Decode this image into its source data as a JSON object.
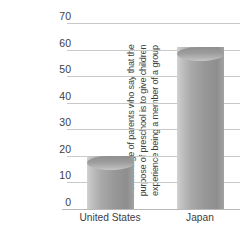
{
  "chart_data": {
    "type": "bar",
    "title": "",
    "xlabel": "",
    "ylabel": "Percentage of parents who say that the purpose of preschool is to give children experience being a member of a group",
    "ylabel_lines": [
      "Percentage of parents who say that the",
      "purpose of preschool is to give children",
      "experience being a member of a group"
    ],
    "categories": [
      "United States",
      "Japan"
    ],
    "values": [
      20,
      61
    ],
    "ylim": [
      0,
      70
    ],
    "ytick_values": [
      0,
      10,
      20,
      30,
      40,
      50,
      60,
      70
    ],
    "ytick_labels": [
      "0",
      "10",
      "20",
      "30",
      "40",
      "50",
      "60",
      "70"
    ],
    "grid": true,
    "legend": false,
    "bar_style": "cylinder",
    "colors": {
      "bar_light": "#d2d2d2",
      "bar_mid": "#a9a9a9",
      "bar_dark": "#8e8e8e",
      "gridline": "#c9c9c9",
      "axis": "#b9b9b9",
      "text": "#3d3d3d",
      "background": "#ffffff"
    }
  }
}
